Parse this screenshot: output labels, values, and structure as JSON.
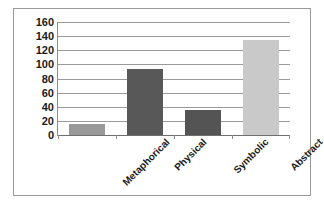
{
  "chart_data": {
    "type": "bar",
    "title": "",
    "subtitle": "",
    "xlabel": "",
    "ylabel": "",
    "categories": [
      "Metaphorical",
      "Physical",
      "Symbolic",
      "Abstract"
    ],
    "values": [
      16,
      94,
      35,
      134
    ],
    "series": [
      {
        "name": "",
        "values": [
          16,
          94,
          35,
          134
        ]
      }
    ],
    "bar_colors": [
      "#999999",
      "#585858",
      "#545454",
      "#c9c9c9"
    ],
    "ylim": [
      0,
      160
    ],
    "ytick_step": 20,
    "ytick_labels": [
      "160",
      "140",
      "120",
      "100",
      "80",
      "60",
      "40",
      "20",
      "0"
    ],
    "ytick_values": [
      160,
      140,
      120,
      100,
      80,
      60,
      40,
      20,
      0
    ],
    "grid": true,
    "grid_axis": "y",
    "grid_color": "#9b9b9b",
    "legend": false,
    "legend_position": "none",
    "axis_line_color": "#8a8a8a",
    "frame_border_color": "#9a9a9a",
    "plot_background": "#ffffff",
    "xtick_label_rotation": -45,
    "annotations": []
  }
}
